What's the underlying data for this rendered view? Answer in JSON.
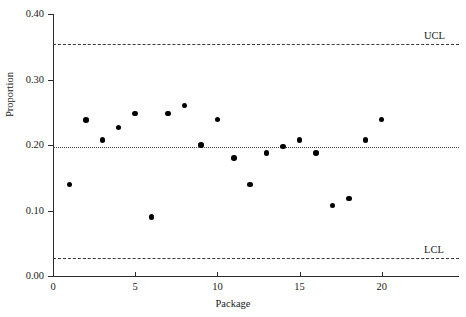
{
  "chart_data": {
    "type": "scatter",
    "title": "",
    "xlabel": "Package",
    "ylabel": "Proportion",
    "xlim": [
      0,
      24.7
    ],
    "ylim": [
      0.0,
      0.4
    ],
    "grid": false,
    "legend": "none",
    "x_ticks": [
      "0",
      "5",
      "10",
      "15",
      "20"
    ],
    "x_tick_values": [
      0,
      5,
      10,
      15,
      20
    ],
    "y_ticks": [
      "0.00",
      "0.10",
      "0.20",
      "0.30",
      "0.40"
    ],
    "y_tick_values": [
      0.0,
      0.1,
      0.2,
      0.3,
      0.4
    ],
    "x": [
      1,
      2,
      3,
      4,
      5,
      6,
      7,
      8,
      9,
      10,
      11,
      12,
      13,
      14,
      15,
      16,
      17,
      18,
      19,
      20
    ],
    "values": [
      0.14,
      0.238,
      0.208,
      0.227,
      0.248,
      0.09,
      0.248,
      0.26,
      0.2,
      0.239,
      0.18,
      0.14,
      0.188,
      0.198,
      0.208,
      0.188,
      0.108,
      0.118,
      0.208,
      0.239
    ],
    "series": [
      {
        "name": "Proportion",
        "marker": "filled-circle",
        "color": "#000000",
        "values": [
          0.14,
          0.238,
          0.208,
          0.227,
          0.248,
          0.09,
          0.248,
          0.26,
          0.2,
          0.239,
          0.18,
          0.14,
          0.188,
          0.198,
          0.208,
          0.188,
          0.108,
          0.118,
          0.208,
          0.239
        ]
      }
    ],
    "reference_lines": [
      {
        "name": "UCL",
        "label": "UCL",
        "value": 0.355,
        "style": "dashed"
      },
      {
        "name": "CL",
        "label": "",
        "value": 0.1975,
        "style": "dotted"
      },
      {
        "name": "LCL",
        "label": "LCL",
        "value": 0.028,
        "style": "dashed"
      }
    ]
  },
  "labels": {
    "ucl": "UCL",
    "lcl": "LCL",
    "x_axis_title": "Package",
    "y_axis_title": "Proportion"
  }
}
